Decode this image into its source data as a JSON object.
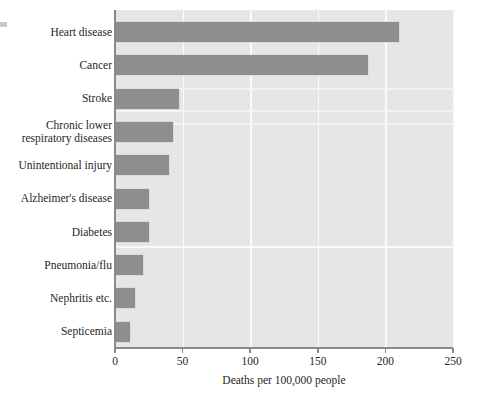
{
  "chart_data": {
    "type": "bar",
    "orientation": "horizontal",
    "title": "",
    "subtitle": "",
    "xlabel": "Deaths per 100,000 people",
    "ylabel": "",
    "xlim": [
      0,
      250
    ],
    "xticks": [
      0,
      50,
      100,
      150,
      200,
      250
    ],
    "xtick_labels": [
      "0",
      "50",
      "100",
      "150",
      "200",
      "250"
    ],
    "grid": "vertical-only",
    "legend": "none",
    "categories": [
      "Heart disease",
      "Cancer",
      "Stroke",
      "Chronic lower\nrespiratory diseases",
      "Unintentional injury",
      "Alzheimer's disease",
      "Diabetes",
      "Pneumonia/flu",
      "Nephritis etc.",
      "Septicemia"
    ],
    "values": [
      210,
      187,
      47,
      43,
      40,
      25,
      25,
      21,
      15,
      11
    ],
    "bar_color": "#8e8e8e",
    "plot_background": "#e6e6e6",
    "gridline_color": "#fbfbfb",
    "axis_color": "#8a8a8a",
    "text_color": "#262626"
  },
  "axis": {
    "x_title": "Deaths per 100,000 people"
  }
}
